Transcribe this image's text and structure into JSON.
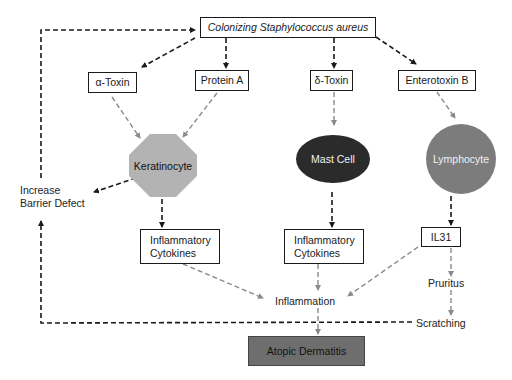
{
  "diagram": {
    "title_node": {
      "label": "Colonizing Staphylococcus aureus"
    },
    "toxins": [
      {
        "id": "alpha-toxin",
        "label": "α-Toxin"
      },
      {
        "id": "protein-a",
        "label": "Protein A"
      },
      {
        "id": "delta-toxin",
        "label": "δ-Toxin"
      },
      {
        "id": "enterotoxin-b",
        "label": "Enterotoxin B"
      }
    ],
    "cells": [
      {
        "id": "keratinocyte",
        "label": "Keratinocyte",
        "shape": "octagon",
        "color": "#b3b3b3"
      },
      {
        "id": "mast-cell",
        "label": "Mast Cell",
        "shape": "ellipse",
        "color": "#2b2b2b"
      },
      {
        "id": "lymphocyte",
        "label": "Lymphocyte",
        "shape": "circle",
        "color": "#7c7c7c"
      }
    ],
    "mediators": {
      "cytokines_left": {
        "line1": "Inflammatory",
        "line2": "Cytokines"
      },
      "cytokines_mid": {
        "line1": "Inflammatory",
        "line2": "Cytokines"
      },
      "il31": "IL31"
    },
    "outcomes": {
      "barrier_line1": "Increase",
      "barrier_line2": "Barrier Defect",
      "inflammation": "Inflammation",
      "pruritus": "Pruritus",
      "scratching": "Scratching",
      "atopic_dermatitis": "Atopic Dermatitis"
    },
    "colors": {
      "black_arrow": "#1a1a1a",
      "gray_arrow": "#8a8a8a",
      "atopic_dermatitis_fill": "#6e6e6e"
    }
  }
}
